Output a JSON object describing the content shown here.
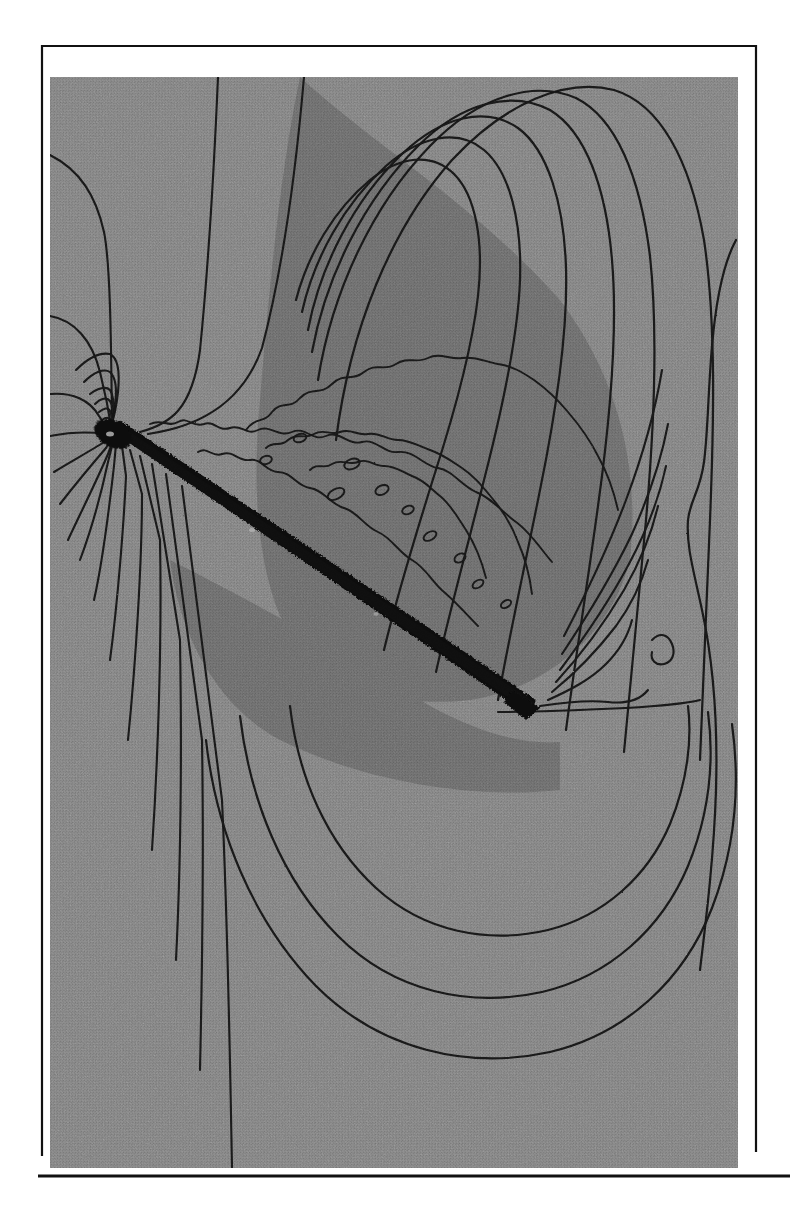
{
  "figure": {
    "kind": "scanned-contour-plot",
    "caption": "",
    "background_color": "#ffffff",
    "panel_color": "#8b8b8b",
    "contour_color": "#1a1a1a",
    "body_color": "#101010",
    "frame_color": "#111111",
    "panel": {
      "x": 50,
      "y": 77,
      "width": 688,
      "height": 1091
    },
    "frame": {
      "x": 41,
      "y": 45,
      "width": 715,
      "height": 1112,
      "line_width": 2
    },
    "bottom_rule": {
      "x1": 38,
      "y1": 1176,
      "x2": 790,
      "y2": 1176,
      "line_width": 3
    }
  },
  "chart_data": {
    "type": "contour",
    "title": "",
    "subtitle": "",
    "xlabel": "",
    "ylabel": "",
    "legend": [],
    "annotations": [],
    "grid": false,
    "axis_ticks": [],
    "tick_labels": [],
    "xlim": [
      0,
      1
    ],
    "ylim": [
      0,
      1
    ],
    "features": [
      {
        "name": "leading-edge-singularity",
        "x": 112,
        "y": 436,
        "radial_contour_count": 20
      },
      {
        "name": "trailing-edge",
        "x": 530,
        "y": 708
      },
      {
        "name": "plate-body",
        "x1": 112,
        "y1": 436,
        "x2": 532,
        "y2": 710,
        "thickness": 13,
        "angle_deg": 33
      },
      {
        "name": "separated-shear-layer",
        "region": "above plate, jagged contours with closed islands"
      },
      {
        "name": "upper-arch-contour-family",
        "count": 7
      },
      {
        "name": "lower-sweep-contour-family",
        "count": 7
      },
      {
        "name": "right-outer-contour",
        "count": 2
      }
    ],
    "contour_levels": [
      0.1,
      0.2,
      0.3,
      0.4,
      0.5,
      0.6,
      0.7,
      0.8,
      0.9,
      1.0,
      1.1,
      1.2,
      1.3,
      1.4,
      1.5,
      1.6,
      1.7,
      1.8,
      1.9,
      2.0
    ],
    "n_contours": 20,
    "shaded_regions": [
      {
        "name": "darker-core-upper-right",
        "shade": "#828282"
      },
      {
        "name": "background-field",
        "shade": "#8b8b8b"
      }
    ]
  }
}
